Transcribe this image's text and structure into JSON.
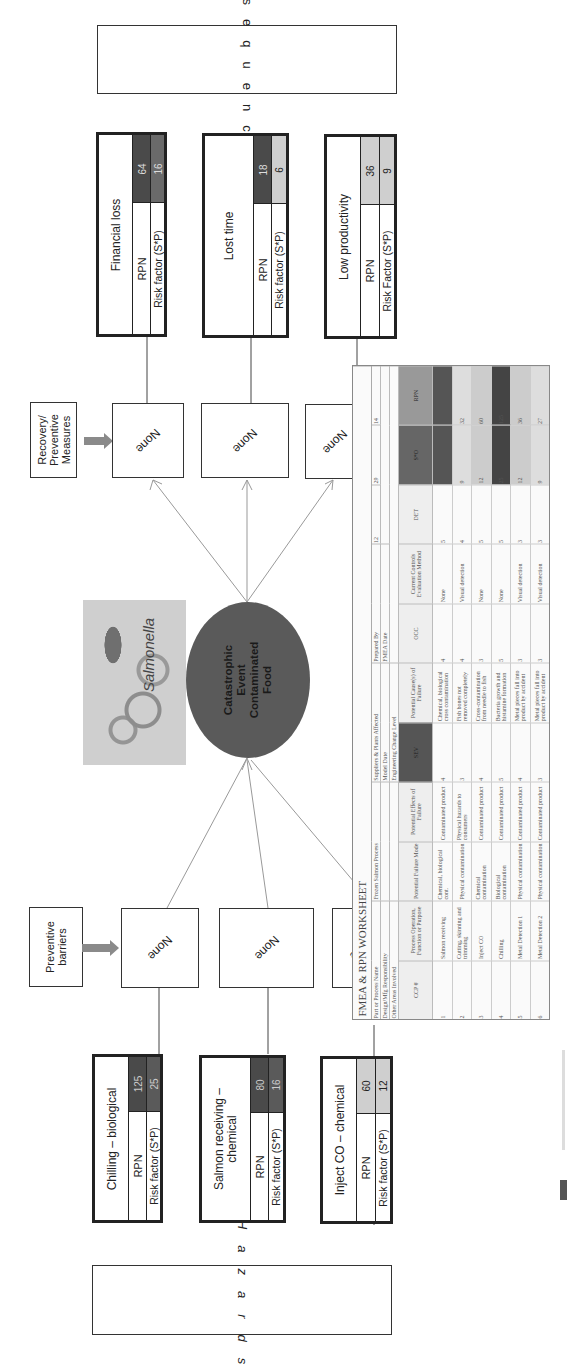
{
  "diagram": {
    "consequences_label": "Consequences",
    "hazards_label": "Hazards",
    "recovery_label_line1": "Recovery/",
    "recovery_label_line2": "Preventive",
    "recovery_label_line3": "Measures",
    "preventive_label_line1": "Preventive",
    "preventive_label_line2": "barriers",
    "central_event": {
      "line1": "Catastrophic",
      "line2": "Event",
      "line3": "Contaminated",
      "line4": "Food",
      "color": "#5a5a5a"
    },
    "image_label": "Salmonella",
    "recovery_measures": [
      "None",
      "None",
      "None"
    ],
    "preventive_barriers": [
      "None",
      "None",
      "None"
    ],
    "consequences": [
      {
        "title": "Financial loss",
        "rpn_label": "RPN",
        "rpn": "64",
        "risk_label": "Risk factor (S*P)",
        "risk": "16",
        "rpn_color": "#4a4a4a",
        "risk_color": "#6a6a6a"
      },
      {
        "title": "Lost time",
        "rpn_label": "RPN",
        "rpn": "18",
        "risk_label": "Risk factor (S*P)",
        "risk": "6",
        "rpn_color": "#4a4a4a",
        "risk_color": "#cfcfcf"
      },
      {
        "title": "Low productivity",
        "rpn_label": "RPN",
        "rpn": "36",
        "risk_label": "Risk Factor (S*P)",
        "risk": "9",
        "rpn_color": "#cfcfcf",
        "risk_color": "#cfcfcf"
      }
    ],
    "hazards": [
      {
        "title": "Chilling – biological",
        "rpn_label": "RPN",
        "rpn": "125",
        "risk_label": "Risk factor (S*P)",
        "risk": "25",
        "rpn_color": "#4a4a4a",
        "risk_color": "#5a5a5a"
      },
      {
        "title_line1": "Salmon receiving –",
        "title_line2": "chemical",
        "rpn_label": "RPN",
        "rpn": "80",
        "risk_label": "Risk factor (S*P)",
        "risk": "16",
        "rpn_color": "#4a4a4a",
        "risk_color": "#5a5a5a"
      },
      {
        "title": "Inject CO – chemical",
        "rpn_label": "RPN",
        "rpn": "60",
        "risk_label": "Risk factor (S*P)",
        "risk": "12",
        "rpn_color": "#cfcfcf",
        "risk_color": "#cfcfcf"
      }
    ]
  },
  "worksheet": {
    "title": "FMEA & RPN WORKSHEET",
    "meta": [
      [
        "Part or Process Name",
        "Frozen Salmon Process",
        "Suppliers & Plants Affected",
        "",
        "Prepared By",
        "",
        "12",
        "29",
        "14"
      ],
      [
        "Design/Mfg Responsibility",
        "",
        "Model Date",
        "",
        "FMEA Date",
        "",
        "",
        "",
        ""
      ],
      [
        "Other Areas Involved",
        "",
        "Engineering Change Level",
        "",
        "",
        "",
        "",
        "",
        ""
      ]
    ],
    "headers": [
      "CCP #",
      "Process Operation, Function or Purpose",
      "Potential Failure Mode",
      "Potential Effects of Failure",
      "SEV",
      "Potential Cause(s) of Failure",
      "OCC",
      "Current Controls Evaluation Method",
      "DET",
      "S*O",
      "RPN"
    ],
    "rows": [
      [
        "1",
        "Salmon receiving",
        "Chemical, biological cont.",
        "Contaminated product",
        "4",
        "Chemical, biological cross contamination",
        "4",
        "None",
        "5",
        "16",
        "80"
      ],
      [
        "2",
        "Cutting, skinning and trimming",
        "Physical contamination",
        "Physical hazards to consumers",
        "3",
        "Fish bones not removed completely",
        "4",
        "Visual detection",
        "4",
        "9",
        "32"
      ],
      [
        "3",
        "Inject CO",
        "Chemical contamination",
        "Contaminated product",
        "4",
        "Cross-contamination from needle to fish",
        "3",
        "None",
        "5",
        "12",
        "60"
      ],
      [
        "4",
        "Chilling",
        "Biological contamination",
        "Contaminated product",
        "5",
        "Bacteria growth and histamine formation",
        "5",
        "None",
        "5",
        "25",
        "125"
      ],
      [
        "5",
        "Metal Detection 1",
        "Physical contamination",
        "Contaminated product",
        "4",
        "Metal pieces fall into product by accident",
        "3",
        "Visual detection",
        "3",
        "12",
        "36"
      ],
      [
        "6",
        "Metal Detection 2",
        "Physical contamination",
        "Contaminated product",
        "3",
        "Metal pieces fall into product by accident",
        "3",
        "Visual detection",
        "3",
        "9",
        "27"
      ]
    ]
  },
  "caption": "Figure"
}
